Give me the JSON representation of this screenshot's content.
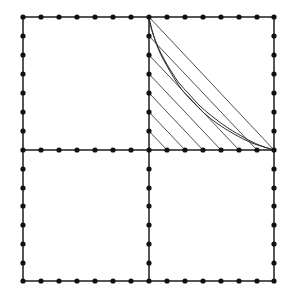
{
  "figure": {
    "title": "",
    "background_color": "#ffffff",
    "line_color": "#3a3a3a",
    "grid_line_color": "#555555",
    "node_color": "#111111",
    "curve_color": "#2b2b2b",
    "canvas": {
      "width": 294,
      "height": 300
    }
  },
  "chart_data": {
    "type": "line",
    "title": "",
    "subtitle": "",
    "xlabel": "",
    "ylabel": "",
    "grid": true,
    "legend_position": "none",
    "annotations": [],
    "square": {
      "left": 23,
      "top": 17,
      "right": 274,
      "bottom": 281,
      "center_x": 149,
      "center_y": 150
    },
    "grid_structure": {
      "divisions_per_half_edge": 7,
      "nodes_per_edge_span": 8,
      "x_step": 18.0,
      "y_step": 18.86,
      "cross_lines": [
        "vertical-center",
        "horizontal-center"
      ],
      "node_radius": 2.6,
      "node_count_total": 60
    },
    "node_x_values": [
      23,
      41,
      59,
      77,
      95,
      113,
      131,
      149,
      167,
      185,
      203,
      221,
      239,
      257,
      274
    ],
    "node_y_values": [
      17,
      36,
      55,
      74,
      93,
      112,
      131,
      150,
      169,
      188,
      206,
      225,
      244,
      263,
      281
    ],
    "envelope": {
      "description": "string-art envelope of segments joining vertical axis points to horizontal axis points",
      "anchor_vertical_x": 149,
      "anchor_horizontal_y": 150,
      "segments": [
        {
          "x1": 149,
          "y1": 17,
          "x2": 274,
          "y2": 150
        },
        {
          "x1": 149,
          "y1": 36,
          "x2": 257,
          "y2": 150
        },
        {
          "x1": 149,
          "y1": 55,
          "x2": 239,
          "y2": 150
        },
        {
          "x1": 149,
          "y1": 74,
          "x2": 221,
          "y2": 150
        },
        {
          "x1": 149,
          "y1": 93,
          "x2": 203,
          "y2": 150
        },
        {
          "x1": 149,
          "y1": 112,
          "x2": 185,
          "y2": 150
        },
        {
          "x1": 149,
          "y1": 131,
          "x2": 167,
          "y2": 150
        }
      ],
      "segment_count": 7
    },
    "curves": [
      {
        "name": "envelope-hyperbola-outer",
        "points": [
          [
            149,
            17
          ],
          [
            152,
            30
          ],
          [
            156,
            43
          ],
          [
            161,
            55
          ],
          [
            167,
            66
          ],
          [
            174,
            78
          ],
          [
            182,
            90
          ],
          [
            192,
            101
          ],
          [
            204,
            113
          ],
          [
            218,
            124
          ],
          [
            234,
            134
          ],
          [
            252,
            143
          ],
          [
            274,
            150
          ]
        ]
      },
      {
        "name": "envelope-hyperbola-inner",
        "points": [
          [
            149,
            20
          ],
          [
            153,
            34
          ],
          [
            158,
            47
          ],
          [
            164,
            59
          ],
          [
            171,
            71
          ],
          [
            179,
            83
          ],
          [
            189,
            94
          ],
          [
            200,
            106
          ],
          [
            213,
            117
          ],
          [
            228,
            128
          ],
          [
            245,
            138
          ],
          [
            259,
            145
          ],
          [
            274,
            150
          ]
        ]
      }
    ],
    "x": [
      149,
      167,
      185,
      203,
      221,
      239,
      257,
      274
    ],
    "values": [
      17,
      36,
      55,
      74,
      93,
      112,
      131,
      150
    ],
    "xlim": [
      23,
      274
    ],
    "ylim": [
      17,
      281
    ]
  }
}
